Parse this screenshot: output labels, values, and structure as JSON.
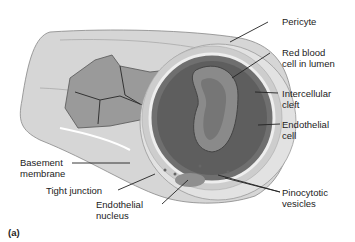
{
  "figure": {
    "panel_label": "(a)",
    "labels": {
      "pericyte": "Pericyte",
      "rbc_1": "Red blood",
      "rbc_2": "cell in lumen",
      "cleft_1": "Intercellular",
      "cleft_2": "cleft",
      "endo_cell_1": "Endothelial",
      "endo_cell_2": "cell",
      "basement_1": "Basement",
      "basement_2": "membrane",
      "tight_junction": "Tight junction",
      "endo_nucleus_1": "Endothelial",
      "endo_nucleus_2": "nucleus",
      "pino_1": "Pinocytotic",
      "pino_2": "vesicles"
    }
  }
}
